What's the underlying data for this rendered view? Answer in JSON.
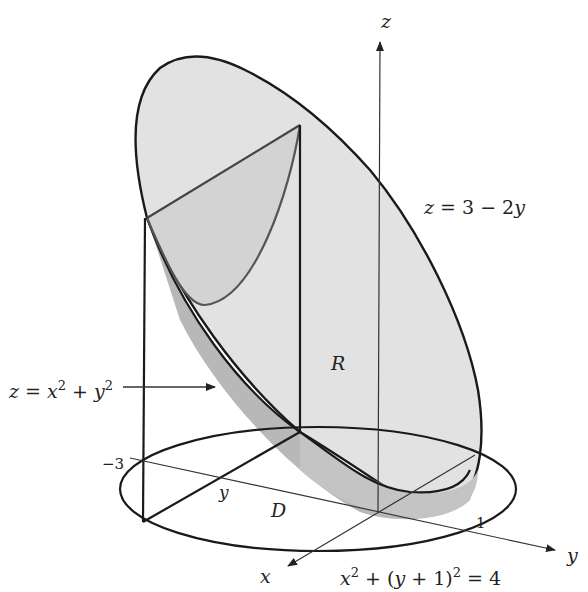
{
  "figure": {
    "type": "3D solid region diagram",
    "colors": {
      "background": "#ffffff",
      "plane_fill": "#e2e2e2",
      "paraboloid_shadow": "#b8b8b8",
      "cross_section_fill": "#d3d3d3",
      "outline": "#1a1a1a",
      "curve": "#555555",
      "axis": "#333333"
    }
  },
  "axes": {
    "x_label": "x",
    "y_label": "y",
    "z_label": "z"
  },
  "labels": {
    "plane_eq": "z = 3 − 2y",
    "paraboloid_eq_prefix": "z = x",
    "paraboloid_exp1": "2",
    "paraboloid_mid": " + y",
    "paraboloid_exp2": "2",
    "region_R": "R",
    "region_D": "D",
    "disk_eq_prefix": "x",
    "disk_exp1": "2",
    "disk_mid": " + (y + 1)",
    "disk_exp2": "2",
    "disk_suffix": " = 4",
    "tick_neg3": "−3",
    "tick_1": "1",
    "y_inner": "y"
  }
}
